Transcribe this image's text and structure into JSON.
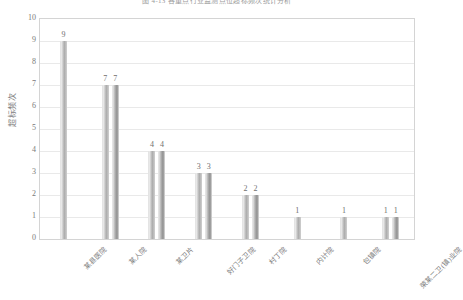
{
  "chart_data": {
    "type": "bar",
    "title": "图 4-13   各重点行业监测点位超标频次统计分析",
    "xlabel": "",
    "ylabel": "超标频次",
    "ylim": [
      0,
      10
    ],
    "ytick_values": [
      0,
      1,
      2,
      3,
      4,
      5,
      6,
      7,
      8,
      9,
      10
    ],
    "grid": true,
    "legend": "none",
    "categories": [
      "某县医院",
      "某人院",
      "某卫片",
      "好门子卫院",
      "村丁院",
      "内计院",
      "包镇院",
      "荣某二卫(镇)业院"
    ],
    "series": [
      {
        "name": "系列1",
        "values": [
          9,
          7,
          4,
          3,
          2,
          1,
          1,
          1
        ]
      },
      {
        "name": "系列2",
        "values": [
          null,
          7,
          4,
          3,
          2,
          null,
          null,
          1
        ]
      }
    ],
    "bar_labels": [
      [
        "9"
      ],
      [
        "7",
        "7"
      ],
      [
        "4",
        "4"
      ],
      [
        "3",
        "3"
      ],
      [
        "2",
        "2"
      ],
      [
        "1"
      ],
      [
        "1"
      ],
      [
        "1",
        "1"
      ]
    ],
    "colors": {
      "series1": "#b8b8b8",
      "series2": "#9e9e9e",
      "gridline": "#e9e9e9",
      "frame": "#d4d4d4",
      "text": "#7a7a7a"
    }
  }
}
